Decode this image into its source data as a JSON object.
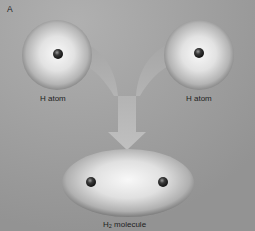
{
  "figure": {
    "panel_letter": "A",
    "atoms": [
      {
        "label": "H atom",
        "position": "left"
      },
      {
        "label": "H atom",
        "position": "right"
      }
    ],
    "molecule": {
      "label_prefix": "H",
      "label_subscript": "2",
      "label_suffix": " molecule"
    },
    "colors": {
      "background": "#9c9c9c",
      "sphere_highlight": "#f4f4f4",
      "sphere_shadow": "#6e6e6e",
      "nucleus": "#2a2a2a",
      "arrow": "#b5b5b5",
      "text": "#1e1e1e"
    }
  }
}
